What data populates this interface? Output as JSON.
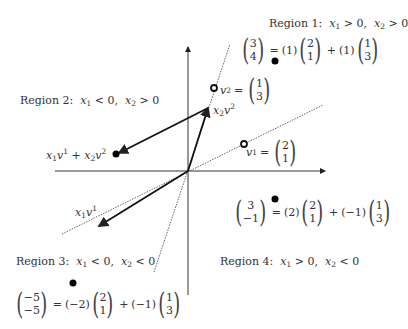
{
  "regions": [
    {
      "id": 1,
      "label": "Region 1:",
      "cond1": "x",
      "sub1": "1",
      "rel1": " > 0,",
      "cond2": "x",
      "sub2": "2",
      "rel2": " > 0"
    },
    {
      "id": 2,
      "label": "Region 2:",
      "cond1": "x",
      "sub1": "1",
      "rel1": " < 0,",
      "cond2": "x",
      "sub2": "2",
      "rel2": " > 0"
    },
    {
      "id": 3,
      "label": "Region 3:",
      "cond1": "x",
      "sub1": "1",
      "rel1": " < 0,",
      "cond2": "x",
      "sub2": "2",
      "rel2": " < 0"
    },
    {
      "id": 4,
      "label": "Region 4:",
      "cond1": "x",
      "sub1": "1",
      "rel1": " > 0,",
      "cond2": "x",
      "sub2": "2",
      "rel2": " < 0"
    }
  ],
  "equations": {
    "region1": {
      "lhs": [
        "3",
        "4"
      ],
      "c1": "(1)",
      "v1": [
        "2",
        "1"
      ],
      "plus": "+",
      "c2": "(1)",
      "v2": [
        "1",
        "3"
      ],
      "eq": "="
    },
    "region4": {
      "lhs": [
        "3",
        "−1"
      ],
      "c1": "(2)",
      "v1": [
        "2",
        "1"
      ],
      "plus": "+",
      "c2": "(−1)",
      "v2": [
        "1",
        "3"
      ],
      "eq": "="
    },
    "region3": {
      "lhs": [
        "−5",
        "−5"
      ],
      "c1": "(−2)",
      "v1": [
        "2",
        "1"
      ],
      "plus": "+",
      "c2": "(−1)",
      "v2": [
        "1",
        "3"
      ],
      "eq": "="
    }
  },
  "vectors": {
    "v1": {
      "name": "v",
      "sup": "1",
      "eq": "=",
      "value": [
        "2",
        "1"
      ]
    },
    "v2": {
      "name": "v",
      "sup": "2",
      "eq": "=",
      "value": [
        "1",
        "3"
      ]
    }
  },
  "labels": {
    "x2v2": {
      "x": "x",
      "sub": "2",
      "v": "v",
      "sup": "2"
    },
    "x1v1": {
      "x": "x",
      "sub": "1",
      "v": "v",
      "sup": "1"
    },
    "sum": {
      "x1": "x",
      "sub1": "1",
      "v1": "v",
      "sup1": "1",
      "plus": " + ",
      "x2": "x",
      "sub2": "2",
      "v2": "v",
      "sup2": "2"
    }
  },
  "colors": {
    "axis": "#333333",
    "vector": "#111111",
    "dotted": "#555555",
    "point": "#000000"
  }
}
